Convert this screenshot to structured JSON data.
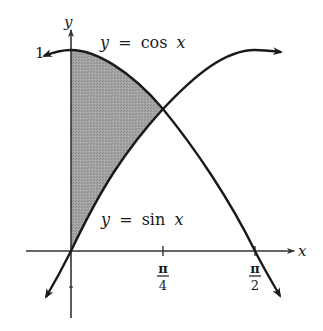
{
  "diagram": {
    "type": "function-graph",
    "axes": {
      "x_label": "x",
      "y_label": "y",
      "x_ticks": [
        {
          "label_num": "π",
          "label_den": "4",
          "value": "π/4"
        },
        {
          "label_num": "π",
          "label_den": "2",
          "value": "π/2"
        }
      ],
      "y_ticks": [
        {
          "label": "1",
          "value": 1
        }
      ]
    },
    "curves": [
      {
        "name": "cosine",
        "label": "y = cos x",
        "label_y": "y",
        "label_eq": "=",
        "label_fn": "cos",
        "label_x": "x"
      },
      {
        "name": "sine",
        "label": "y = sin x",
        "label_y": "y",
        "label_eq": "=",
        "label_fn": "sin",
        "label_x": "x"
      }
    ],
    "shaded_region": {
      "between": [
        "cos x",
        "sin x"
      ],
      "x_from": "0",
      "x_to": "π/4",
      "color": "#9a9a9a"
    },
    "colors": {
      "curve": "#1a1a1a",
      "axis": "#333333",
      "shade": "#9a9a9a",
      "background": "#ffffff"
    }
  }
}
